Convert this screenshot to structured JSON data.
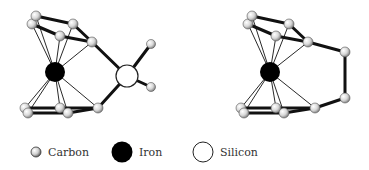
{
  "colors": {
    "background": "#ffffff",
    "bond": "#111111",
    "iron": "#000000",
    "carbon_light": "#f4f4f4",
    "carbon_dark": "#8a8a8a",
    "silicon_fill": "#ffffff",
    "silicon_stroke": "#222222"
  },
  "structures": [
    {
      "name": "silicon-bridged-ferrocenophane",
      "iron": {
        "x": 55,
        "y": 72,
        "r": 10
      },
      "silicon": {
        "x": 127,
        "y": 76,
        "r": 11
      },
      "carbons": [
        {
          "id": "c1",
          "x": 36,
          "y": 16
        },
        {
          "id": "c2",
          "x": 32,
          "y": 24
        },
        {
          "id": "c3",
          "x": 73,
          "y": 24
        },
        {
          "id": "c4",
          "x": 60,
          "y": 36
        },
        {
          "id": "c5",
          "x": 92,
          "y": 42
        },
        {
          "id": "m1",
          "x": 151,
          "y": 44
        },
        {
          "id": "m2",
          "x": 151,
          "y": 87
        },
        {
          "id": "c6",
          "x": 25,
          "y": 108
        },
        {
          "id": "c7",
          "x": 28,
          "y": 113
        },
        {
          "id": "c8",
          "x": 60,
          "y": 108
        },
        {
          "id": "c9",
          "x": 68,
          "y": 113
        },
        {
          "id": "c10",
          "x": 98,
          "y": 108
        }
      ]
    },
    {
      "name": "carbon-bridged-ferrocenophane",
      "iron": {
        "x": 270,
        "y": 72,
        "r": 10
      },
      "carbons": [
        {
          "id": "c1",
          "x": 252,
          "y": 16
        },
        {
          "id": "c2",
          "x": 248,
          "y": 24
        },
        {
          "id": "c3",
          "x": 289,
          "y": 24
        },
        {
          "id": "c4",
          "x": 276,
          "y": 36
        },
        {
          "id": "c5",
          "x": 308,
          "y": 42
        },
        {
          "id": "b1",
          "x": 345,
          "y": 52
        },
        {
          "id": "b2",
          "x": 345,
          "y": 98
        },
        {
          "id": "c6",
          "x": 241,
          "y": 108
        },
        {
          "id": "c7",
          "x": 244,
          "y": 113
        },
        {
          "id": "c8",
          "x": 276,
          "y": 108
        },
        {
          "id": "c9",
          "x": 284,
          "y": 113
        },
        {
          "id": "c10",
          "x": 315,
          "y": 108
        }
      ]
    }
  ],
  "legend": [
    {
      "label": "Carbon",
      "icon": "carbon-atom-icon"
    },
    {
      "label": "Iron",
      "icon": "iron-atom-icon"
    },
    {
      "label": "Silicon",
      "icon": "silicon-atom-icon"
    }
  ]
}
